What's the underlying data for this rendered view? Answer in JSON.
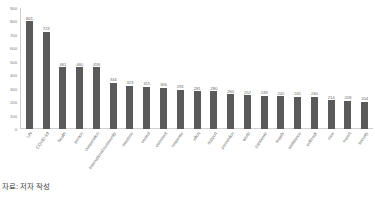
{
  "caption": "자료: 저자 작성",
  "chart_data": {
    "type": "bar",
    "title": "",
    "xlabel": "",
    "ylabel": "",
    "ylim": [
      0,
      900
    ],
    "grid": false,
    "legend": "none",
    "bar_color": "#5a5a5a",
    "yticks": [
      900,
      800,
      700,
      600,
      500,
      400,
      300,
      200,
      100,
      0
    ],
    "categories": [
      "UN",
      "COVID-19",
      "health",
      "person",
      "cooperation",
      "international community",
      "measure",
      "control",
      "comment",
      "response",
      "effort",
      "support",
      "prevention",
      "world",
      "pandemic",
      "supply",
      "assistance",
      "outbreak",
      "care",
      "expert",
      "security"
    ],
    "values": [
      801,
      723,
      461,
      460,
      458,
      344,
      323,
      315,
      306,
      291,
      281,
      280,
      260,
      252,
      249,
      242,
      241,
      240,
      214,
      209,
      204
    ]
  }
}
